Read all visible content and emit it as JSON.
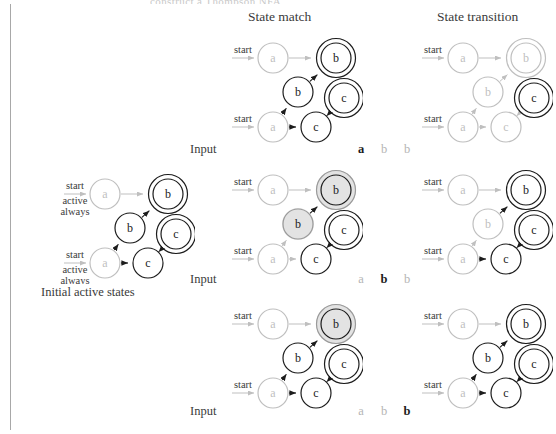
{
  "page": {
    "running_head": "construct a Thompson NFA",
    "rule_color": "#a8a8a8"
  },
  "palette": {
    "active": "#1c1c1c",
    "inactive": "#bfbfbf",
    "highlight_fill": "#e3e3e3",
    "highlight_ring": "#9a9a9a",
    "text_active": "#1c1c1c",
    "text_inactive": "#b4b4b4"
  },
  "headers": {
    "state_match": "State match",
    "state_transition": "State transition"
  },
  "captions": {
    "initial_active_states": "Initial active states"
  },
  "labels": {
    "input": "Input",
    "start": "start",
    "active": "active",
    "always": "always",
    "node_a": "a",
    "node_b": "b",
    "node_c": "c"
  },
  "input_rows": [
    {
      "label": "Input",
      "symbols": [
        {
          "char": "a",
          "state": "on"
        },
        {
          "char": "b",
          "state": "off"
        },
        {
          "char": "b",
          "state": "off"
        }
      ]
    },
    {
      "label": "Input",
      "symbols": [
        {
          "char": "a",
          "state": "off"
        },
        {
          "char": "b",
          "state": "on"
        },
        {
          "char": "b",
          "state": "off"
        }
      ]
    },
    {
      "label": "Input",
      "symbols": [
        {
          "char": "a",
          "state": "off"
        },
        {
          "char": "b",
          "state": "off"
        },
        {
          "char": "b",
          "state": "on"
        }
      ]
    }
  ],
  "automata": {
    "layout": {
      "nodes": [
        {
          "id": "a1",
          "label": "a",
          "cx": 60,
          "cy": 28,
          "r": 15
        },
        {
          "id": "b1",
          "label": "b",
          "cx": 123,
          "cy": 28,
          "r": 15,
          "accept": true
        },
        {
          "id": "b2",
          "label": "b",
          "cx": 85,
          "cy": 62,
          "r": 15
        },
        {
          "id": "c2",
          "label": "c",
          "cx": 131,
          "cy": 68,
          "r": 15,
          "accept": true
        },
        {
          "id": "a2",
          "label": "a",
          "cx": 60,
          "cy": 97,
          "r": 15
        },
        {
          "id": "c1",
          "label": "c",
          "cx": 103,
          "cy": 97,
          "r": 15
        }
      ],
      "edges": [
        {
          "from": "a1",
          "to": "b1"
        },
        {
          "from": "b2",
          "to": "b1"
        },
        {
          "from": "a2",
          "to": "b2"
        },
        {
          "from": "a2",
          "to": "c1"
        },
        {
          "from": "c1",
          "to": "c2"
        }
      ],
      "start_arrows": [
        {
          "to": "a1",
          "label": "start"
        },
        {
          "to": "a2",
          "label": "start"
        }
      ]
    },
    "panels": [
      {
        "id": "initial",
        "column": "initial",
        "row": 0,
        "caption": "Initial active states",
        "start_sublabels": [
          "active",
          "always"
        ],
        "node_states": {
          "a1": "inactive",
          "b1": "active",
          "b2": "active",
          "c2": "active",
          "a2": "inactive",
          "c1": "active"
        },
        "edge_states": {
          "a1-b1": "inactive",
          "b2-b1": "active",
          "a2-b2": "active",
          "a2-c1": "active",
          "c1-c2": "active"
        }
      },
      {
        "id": "match-1",
        "column": "state_match",
        "row": 1,
        "node_states": {
          "a1": "inactive",
          "b1": "active",
          "b2": "active",
          "c2": "active",
          "a2": "inactive",
          "c1": "active"
        },
        "edge_states": {
          "a1-b1": "inactive",
          "b2-b1": "active",
          "a2-b2": "active",
          "a2-c1": "active",
          "c1-c2": "active"
        }
      },
      {
        "id": "transition-1",
        "column": "state_transition",
        "row": 1,
        "node_states": {
          "a1": "inactive",
          "b1": "inactive",
          "b2": "inactive",
          "c2": "active",
          "a2": "inactive",
          "c1": "inactive"
        },
        "edge_states": {
          "a1-b1": "inactive",
          "b2-b1": "inactive",
          "a2-b2": "inactive",
          "a2-c1": "inactive",
          "c1-c2": "inactive"
        }
      },
      {
        "id": "match-2",
        "column": "state_match",
        "row": 2,
        "node_states": {
          "a1": "inactive",
          "b1": "highlight",
          "b2": "highlight",
          "c2": "active",
          "a2": "inactive",
          "c1": "active"
        },
        "edge_states": {
          "a1-b1": "inactive",
          "b2-b1": "active",
          "a2-b2": "inactive",
          "a2-c1": "inactive",
          "c1-c2": "active"
        }
      },
      {
        "id": "transition-2",
        "column": "state_transition",
        "row": 2,
        "node_states": {
          "a1": "inactive",
          "b1": "active",
          "b2": "inactive",
          "c2": "active",
          "a2": "inactive",
          "c1": "active"
        },
        "edge_states": {
          "a1-b1": "inactive",
          "b2-b1": "active",
          "a2-b2": "inactive",
          "a2-c1": "active",
          "c1-c2": "active"
        }
      },
      {
        "id": "match-3",
        "column": "state_match",
        "row": 3,
        "node_states": {
          "a1": "inactive",
          "b1": "highlight",
          "b2": "active",
          "c2": "active",
          "a2": "inactive",
          "c1": "active"
        },
        "edge_states": {
          "a1-b1": "inactive",
          "b2-b1": "active",
          "a2-b2": "active",
          "a2-c1": "active",
          "c1-c2": "active"
        }
      },
      {
        "id": "transition-3",
        "column": "state_transition",
        "row": 3,
        "node_states": {
          "a1": "inactive",
          "b1": "active",
          "b2": "active",
          "c2": "active",
          "a2": "inactive",
          "c1": "active"
        },
        "edge_states": {
          "a1-b1": "inactive",
          "b2-b1": "active",
          "a2-b2": "active",
          "a2-c1": "active",
          "c1-c2": "active"
        }
      }
    ]
  }
}
